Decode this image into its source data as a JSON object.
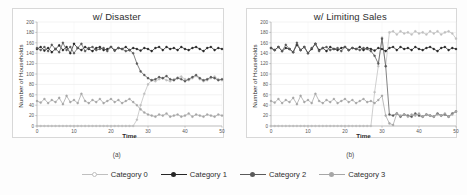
{
  "figure": {
    "background_color": "#fdfdfd",
    "panel_border_color": "#d8d8d8"
  },
  "legend": {
    "position": "bottom-center",
    "entries": [
      {
        "label": "Category 0",
        "color": "#bfbfbf",
        "marker": "circle-open"
      },
      {
        "label": "Category 1",
        "color": "#262626",
        "marker": "circle-filled"
      },
      {
        "label": "Category 2",
        "color": "#5a5a5a",
        "marker": "circle-filled"
      },
      {
        "label": "Category 3",
        "color": "#a6a6a6",
        "marker": "circle-filled"
      }
    ]
  },
  "panels": [
    {
      "id": "panel-a",
      "caption": "(a)",
      "title": "w/ Disaster"
    },
    {
      "id": "panel-b",
      "caption": "(b)",
      "title": "w/ Limiting Sales"
    }
  ],
  "chart_data": [
    {
      "type": "line",
      "title": "w/ Disaster",
      "caption": "(a)",
      "xlabel": "Time",
      "ylabel": "Number of Households",
      "xlim": [
        0,
        50
      ],
      "ylim": [
        0,
        200
      ],
      "xticks": [
        0,
        10,
        20,
        30,
        40,
        50
      ],
      "yticks": [
        0,
        20,
        40,
        60,
        80,
        100,
        120,
        140,
        160,
        180,
        200
      ],
      "grid": true,
      "grid_axis": "y",
      "legend_position": "figure-bottom",
      "annotation": "Disaster event occurs near t=26; Category 1 declines from ~150 to ~90 while Category 0 rises from 0 to ~95 and Category 2 drops from ~48 to ~20.",
      "x": [
        0,
        1,
        2,
        3,
        4,
        5,
        6,
        7,
        8,
        9,
        10,
        11,
        12,
        13,
        14,
        15,
        16,
        17,
        18,
        19,
        20,
        21,
        22,
        23,
        24,
        25,
        26,
        27,
        28,
        29,
        30,
        31,
        32,
        33,
        34,
        35,
        36,
        37,
        38,
        39,
        40,
        41,
        42,
        43,
        44,
        45,
        46,
        47,
        48,
        49,
        50
      ],
      "series": [
        {
          "name": "Category 0",
          "color": "#bfbfbf",
          "values": [
            0,
            0,
            0,
            0,
            0,
            0,
            0,
            0,
            0,
            0,
            0,
            0,
            0,
            0,
            0,
            0,
            0,
            0,
            0,
            0,
            0,
            0,
            0,
            0,
            0,
            0,
            0,
            12,
            40,
            62,
            80,
            88,
            86,
            90,
            92,
            88,
            86,
            90,
            93,
            95,
            90,
            88,
            92,
            96,
            90,
            86,
            88,
            92,
            95,
            90,
            88
          ]
        },
        {
          "name": "Category 1",
          "color": "#262626",
          "values": [
            148,
            152,
            145,
            150,
            142,
            148,
            155,
            146,
            152,
            140,
            158,
            150,
            146,
            152,
            148,
            144,
            150,
            152,
            146,
            148,
            152,
            145,
            150,
            148,
            152,
            146,
            150,
            148,
            145,
            150,
            148,
            144,
            150,
            152,
            146,
            152,
            148,
            150,
            146,
            152,
            148,
            146,
            150,
            152,
            148,
            144,
            150,
            152,
            146,
            150,
            148
          ]
        },
        {
          "name": "Category 2",
          "color": "#5a5a5a",
          "values": [
            150,
            146,
            152,
            144,
            156,
            148,
            142,
            160,
            146,
            152,
            140,
            150,
            158,
            144,
            150,
            152,
            146,
            148,
            150,
            144,
            152,
            146,
            150,
            148,
            144,
            146,
            140,
            120,
            105,
            98,
            92,
            88,
            90,
            94,
            92,
            96,
            90,
            88,
            92,
            90,
            86,
            90,
            94,
            98,
            92,
            88,
            90,
            94,
            92,
            88,
            90
          ]
        },
        {
          "name": "Category 3",
          "color": "#a6a6a6",
          "values": [
            48,
            45,
            52,
            44,
            50,
            46,
            54,
            42,
            58,
            46,
            50,
            44,
            62,
            48,
            44,
            50,
            46,
            52,
            44,
            48,
            52,
            46,
            50,
            44,
            48,
            52,
            46,
            40,
            32,
            26,
            22,
            20,
            18,
            22,
            20,
            24,
            18,
            20,
            22,
            18,
            20,
            24,
            18,
            22,
            20,
            18,
            22,
            20,
            18,
            22,
            20
          ]
        }
      ]
    },
    {
      "type": "line",
      "title": "w/ Limiting Sales",
      "caption": "(b)",
      "xlabel": "Time",
      "ylabel": "Number of Households",
      "xlim": [
        0,
        50
      ],
      "ylim": [
        0,
        200
      ],
      "xticks": [
        0,
        10,
        20,
        30,
        40,
        50
      ],
      "yticks": [
        0,
        20,
        40,
        60,
        80,
        100,
        120,
        140,
        160,
        180,
        200
      ],
      "grid": true,
      "grid_axis": "y",
      "legend_position": "figure-bottom",
      "annotation": "Sales limiting starts near t=27; Category 0 rises sharply crossing Category 2 around t=29, spikes to ~170 at t=30, dips to ~115 at t=31 then stabilizes near ~182. Category 2 falls to ~20.",
      "x": [
        0,
        1,
        2,
        3,
        4,
        5,
        6,
        7,
        8,
        9,
        10,
        11,
        12,
        13,
        14,
        15,
        16,
        17,
        18,
        19,
        20,
        21,
        22,
        23,
        24,
        25,
        26,
        27,
        28,
        29,
        30,
        31,
        32,
        33,
        34,
        35,
        36,
        37,
        38,
        39,
        40,
        41,
        42,
        43,
        44,
        45,
        46,
        47,
        48,
        49,
        50
      ],
      "series": [
        {
          "name": "Category 0",
          "color": "#bfbfbf",
          "values": [
            0,
            0,
            0,
            0,
            0,
            0,
            0,
            0,
            0,
            0,
            0,
            0,
            0,
            0,
            0,
            0,
            0,
            0,
            0,
            0,
            0,
            0,
            0,
            0,
            0,
            0,
            0,
            0,
            65,
            115,
            170,
            115,
            180,
            182,
            176,
            182,
            178,
            180,
            176,
            182,
            178,
            180,
            176,
            182,
            178,
            182,
            176,
            180,
            182,
            178,
            168
          ]
        },
        {
          "name": "Category 1",
          "color": "#262626",
          "values": [
            150,
            146,
            152,
            144,
            150,
            148,
            142,
            156,
            146,
            152,
            140,
            148,
            158,
            146,
            150,
            144,
            152,
            148,
            146,
            150,
            152,
            146,
            150,
            148,
            152,
            146,
            150,
            148,
            145,
            150,
            148,
            144,
            150,
            152,
            146,
            152,
            148,
            150,
            146,
            152,
            148,
            146,
            150,
            152,
            148,
            144,
            150,
            152,
            146,
            150,
            148
          ]
        },
        {
          "name": "Category 2",
          "color": "#5a5a5a",
          "values": [
            150,
            146,
            152,
            144,
            156,
            148,
            142,
            160,
            146,
            152,
            140,
            150,
            158,
            144,
            150,
            152,
            146,
            148,
            150,
            144,
            152,
            146,
            150,
            148,
            146,
            150,
            148,
            144,
            135,
            120,
            168,
            115,
            22,
            20,
            24,
            18,
            22,
            20,
            18,
            24,
            20,
            18,
            22,
            20,
            18,
            24,
            20,
            22,
            18,
            24,
            28
          ]
        },
        {
          "name": "Category 3",
          "color": "#a6a6a6",
          "values": [
            48,
            45,
            52,
            44,
            50,
            46,
            54,
            42,
            58,
            46,
            50,
            44,
            62,
            48,
            44,
            50,
            46,
            52,
            44,
            48,
            52,
            46,
            50,
            44,
            48,
            52,
            46,
            48,
            44,
            50,
            58,
            20,
            5,
            2,
            24,
            20,
            22,
            18,
            22,
            20,
            24,
            18,
            22,
            20,
            18,
            22,
            20,
            24,
            18,
            22,
            28
          ]
        }
      ]
    }
  ]
}
